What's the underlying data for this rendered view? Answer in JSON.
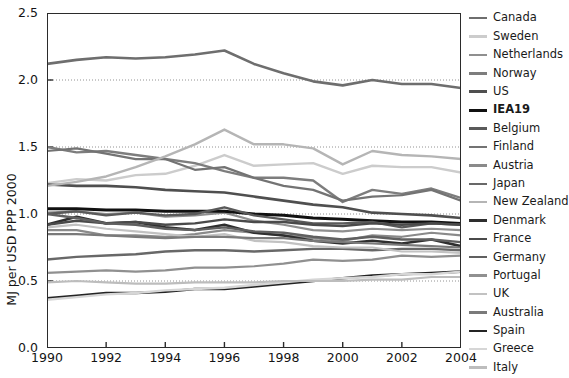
{
  "chart_data": {
    "type": "line",
    "title": "",
    "xlabel": "",
    "ylabel": "MJ per USD PPP 2000",
    "xlim": [
      1990,
      2004
    ],
    "ylim": [
      0.0,
      2.5
    ],
    "xticks": [
      1990,
      1992,
      1994,
      1996,
      1998,
      2000,
      2002,
      2004
    ],
    "xtick_labels": [
      "1990",
      "1992",
      "1994",
      "1996",
      "1998",
      "2000",
      "2002",
      "2004"
    ],
    "yticks": [
      0.0,
      0.5,
      1.0,
      1.5,
      2.0,
      2.5
    ],
    "ytick_labels": [
      "0.0",
      "0.5",
      "1.0",
      "1.5",
      "2.0",
      "2.5"
    ],
    "grid": "horizontal-dotted",
    "gridlines": [
      0.5,
      1.0,
      1.5,
      2.0
    ],
    "legend_position": "right",
    "x": [
      1990,
      1991,
      1992,
      1993,
      1994,
      1995,
      1996,
      1997,
      1998,
      1999,
      2000,
      2001,
      2002,
      2003,
      2004
    ],
    "series": [
      {
        "name": "Canada",
        "color": "#6e6e6e",
        "width": 2.6,
        "values": [
          2.12,
          2.15,
          2.17,
          2.16,
          2.17,
          2.19,
          2.22,
          2.12,
          2.05,
          1.99,
          1.96,
          2.0,
          1.97,
          1.97,
          1.94
        ]
      },
      {
        "name": "Sweden",
        "color": "#cccccc",
        "width": 2.4,
        "values": [
          1.23,
          1.26,
          1.25,
          1.29,
          1.3,
          1.36,
          1.44,
          1.36,
          1.37,
          1.38,
          1.3,
          1.36,
          1.35,
          1.35,
          1.31
        ]
      },
      {
        "name": "Netherlands",
        "color": "#8f8f8f",
        "width": 2.2,
        "values": [
          1.01,
          1.02,
          1.0,
          1.01,
          0.98,
          0.99,
          1.01,
          0.95,
          0.92,
          0.88,
          0.87,
          0.89,
          0.88,
          0.89,
          0.88
        ]
      },
      {
        "name": "Norway",
        "color": "#7d7d7d",
        "width": 2.4,
        "values": [
          1.5,
          1.46,
          1.47,
          1.44,
          1.41,
          1.38,
          1.32,
          1.27,
          1.27,
          1.25,
          1.09,
          1.18,
          1.15,
          1.19,
          1.12
        ]
      },
      {
        "name": "US",
        "color": "#4f4f4f",
        "width": 2.6,
        "values": [
          1.22,
          1.21,
          1.21,
          1.2,
          1.18,
          1.17,
          1.16,
          1.13,
          1.1,
          1.07,
          1.05,
          1.01,
          1.0,
          0.99,
          0.97
        ]
      },
      {
        "name": "IEA19",
        "color": "#111111",
        "width": 3.0,
        "values": [
          1.04,
          1.04,
          1.03,
          1.03,
          1.02,
          1.02,
          1.02,
          1.0,
          0.99,
          0.97,
          0.96,
          0.95,
          0.94,
          0.94,
          0.93
        ]
      },
      {
        "name": "Belgium",
        "color": "#5a5a5a",
        "width": 2.4,
        "values": [
          1.0,
          1.02,
          0.99,
          1.01,
          0.99,
          1.0,
          1.05,
          0.99,
          0.96,
          0.93,
          0.93,
          0.94,
          0.9,
          0.93,
          0.92
        ]
      },
      {
        "name": "Finland",
        "color": "#737373",
        "width": 2.2,
        "values": [
          1.47,
          1.49,
          1.45,
          1.41,
          1.41,
          1.33,
          1.35,
          1.27,
          1.21,
          1.18,
          1.1,
          1.13,
          1.14,
          1.18,
          1.1
        ]
      },
      {
        "name": "Austria",
        "color": "#8a8a8a",
        "width": 2.2,
        "values": [
          0.88,
          0.88,
          0.84,
          0.84,
          0.83,
          0.85,
          0.88,
          0.86,
          0.84,
          0.82,
          0.8,
          0.84,
          0.83,
          0.86,
          0.84
        ]
      },
      {
        "name": "Japan",
        "color": "#686868",
        "width": 2.4,
        "values": [
          0.66,
          0.68,
          0.69,
          0.7,
          0.72,
          0.73,
          0.73,
          0.72,
          0.73,
          0.74,
          0.74,
          0.73,
          0.74,
          0.74,
          0.73
        ]
      },
      {
        "name": "New Zealand",
        "color": "#b5b5b5",
        "width": 2.4,
        "values": [
          1.21,
          1.24,
          1.28,
          1.35,
          1.43,
          1.52,
          1.63,
          1.52,
          1.52,
          1.49,
          1.37,
          1.47,
          1.44,
          1.43,
          1.41
        ]
      },
      {
        "name": "Denmark",
        "color": "#2e2e2e",
        "width": 2.6,
        "values": [
          0.92,
          0.98,
          0.93,
          0.94,
          0.9,
          0.88,
          0.92,
          0.86,
          0.84,
          0.8,
          0.78,
          0.8,
          0.78,
          0.81,
          0.76
        ]
      },
      {
        "name": "France",
        "color": "#4a4a4a",
        "width": 2.4,
        "values": [
          0.92,
          0.95,
          0.93,
          0.94,
          0.92,
          0.93,
          0.96,
          0.94,
          0.94,
          0.92,
          0.91,
          0.93,
          0.92,
          0.93,
          0.92
        ]
      },
      {
        "name": "Germany",
        "color": "#606060",
        "width": 2.4,
        "values": [
          1.0,
          0.97,
          0.93,
          0.92,
          0.89,
          0.88,
          0.9,
          0.87,
          0.86,
          0.83,
          0.81,
          0.83,
          0.81,
          0.81,
          0.79
        ]
      },
      {
        "name": "Portugal",
        "color": "#909090",
        "width": 2.2,
        "values": [
          0.56,
          0.57,
          0.58,
          0.57,
          0.58,
          0.6,
          0.6,
          0.61,
          0.63,
          0.66,
          0.65,
          0.66,
          0.69,
          0.68,
          0.69
        ]
      },
      {
        "name": "UK",
        "color": "#c2c2c2",
        "width": 2.2,
        "values": [
          0.9,
          0.92,
          0.89,
          0.87,
          0.85,
          0.83,
          0.85,
          0.8,
          0.79,
          0.76,
          0.75,
          0.75,
          0.72,
          0.72,
          0.71
        ]
      },
      {
        "name": "Australia",
        "color": "#7a7a7a",
        "width": 2.2,
        "values": [
          0.85,
          0.85,
          0.84,
          0.83,
          0.82,
          0.83,
          0.83,
          0.82,
          0.82,
          0.8,
          0.79,
          0.78,
          0.77,
          0.76,
          0.75
        ]
      },
      {
        "name": "Spain",
        "color": "#242424",
        "width": 2.6,
        "values": [
          0.37,
          0.39,
          0.41,
          0.41,
          0.42,
          0.44,
          0.44,
          0.46,
          0.48,
          0.5,
          0.52,
          0.54,
          0.55,
          0.56,
          0.57
        ]
      },
      {
        "name": "Greece",
        "color": "#d6d6d6",
        "width": 2.4,
        "values": [
          0.36,
          0.38,
          0.4,
          0.41,
          0.43,
          0.44,
          0.45,
          0.47,
          0.49,
          0.51,
          0.52,
          0.53,
          0.55,
          0.55,
          0.57
        ]
      },
      {
        "name": "Italy",
        "color": "#bdbdbd",
        "width": 2.2,
        "values": [
          0.49,
          0.5,
          0.49,
          0.48,
          0.48,
          0.49,
          0.49,
          0.49,
          0.5,
          0.5,
          0.5,
          0.51,
          0.51,
          0.53,
          0.53
        ]
      }
    ]
  }
}
